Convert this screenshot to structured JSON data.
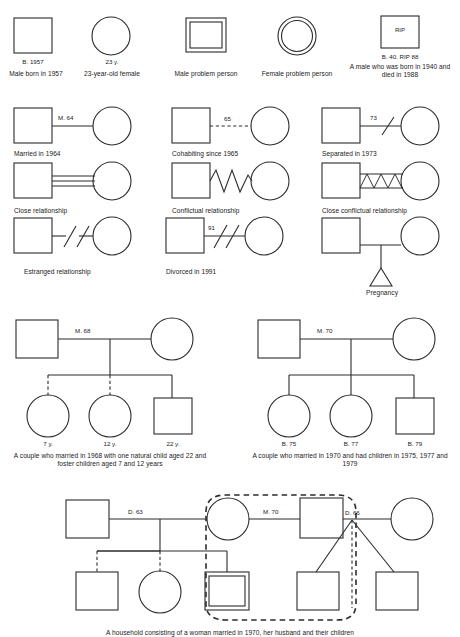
{
  "figure": {
    "stroke_color": "#2b2b2b",
    "background": "#ffffff"
  },
  "row1": {
    "items": [
      {
        "symbol": "square",
        "code": "B. 1957",
        "caption": "Male born in 1957"
      },
      {
        "symbol": "circle",
        "code": "23 y.",
        "caption": "23-year-old female"
      },
      {
        "symbol": "double-square",
        "code": "",
        "caption": "Male problem person"
      },
      {
        "symbol": "double-circle",
        "code": "",
        "caption": "Female problem person"
      },
      {
        "symbol": "square-rip",
        "inner_text": "RIP",
        "code": "B. 40. RIP 88",
        "caption": "A male who was born in 1940 and died in 1988"
      }
    ]
  },
  "row2": {
    "items": [
      {
        "link": "solid-line",
        "link_label": "M. 64",
        "caption": "Married in 1964"
      },
      {
        "link": "dashed-line",
        "link_label": "65",
        "caption": "Cohabiting since 1965"
      },
      {
        "link": "single-slash",
        "link_label": "73",
        "caption": "Separated in 1973"
      }
    ]
  },
  "row3": {
    "items": [
      {
        "link": "triple-line",
        "link_label": "",
        "caption": "Close relationship"
      },
      {
        "link": "zigzag",
        "link_label": "",
        "caption": "Conflictual relationship"
      },
      {
        "link": "triple-line-zigzag",
        "link_label": "",
        "caption": "Close conflictual relationship"
      }
    ]
  },
  "row4": {
    "items": [
      {
        "link": "double-slash-gap",
        "link_label": "",
        "caption": "Estranged relationship"
      },
      {
        "link": "double-slash",
        "link_label": "91",
        "caption": "Divorced in 1991"
      },
      {
        "link": "child-triangle",
        "link_label": "",
        "caption": "Pregnancy"
      }
    ]
  },
  "family_left": {
    "union_label": "M. 68",
    "children": [
      {
        "symbol": "circle",
        "label": "7 y.",
        "line": "dashed"
      },
      {
        "symbol": "circle",
        "label": "12 y.",
        "line": "dashed"
      },
      {
        "symbol": "square",
        "label": "22 y.",
        "line": "solid"
      }
    ],
    "caption": "A couple who married in 1968 with one natural child aged 22 and foster children aged 7 and 12 years"
  },
  "family_right": {
    "union_label": "M. 70",
    "children": [
      {
        "symbol": "circle",
        "label": "B. 75",
        "line": "solid"
      },
      {
        "symbol": "circle",
        "label": "B. 77",
        "line": "solid"
      },
      {
        "symbol": "square",
        "label": "B. 79",
        "line": "solid"
      }
    ],
    "caption": "A couple who married in 1970 and had children in 1975, 1977 and 1979"
  },
  "family_bottom": {
    "labels": {
      "first_union": "D. 63",
      "second_union": "M. 70",
      "third_union": "D. 66"
    },
    "household_outline": "dashed-rounded",
    "caption": "A household consisting of a woman married in 1970, her husband and their children"
  }
}
